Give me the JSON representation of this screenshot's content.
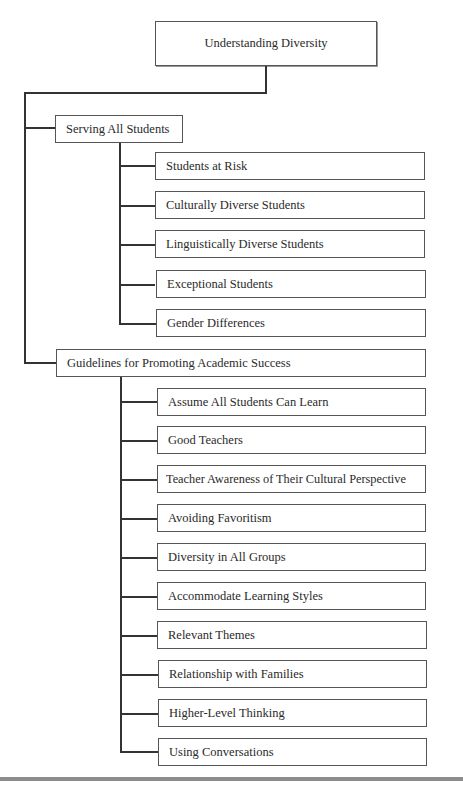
{
  "diagram": {
    "root": {
      "label": "Understanding Diversity"
    },
    "branches": [
      {
        "label": "Serving All Students",
        "children": [
          "Students at Risk",
          "Culturally Diverse Students",
          "Linguistically Diverse Students",
          "Exceptional Students",
          "Gender Differences"
        ]
      },
      {
        "label": "Guidelines for Promoting Academic Success",
        "children": [
          "Assume All Students Can Learn",
          "Good Teachers",
          "Teacher Awareness of Their Cultural Perspective",
          "Avoiding Favoritism",
          "Diversity in All Groups",
          "Accommodate Learning Styles",
          "Relevant Themes",
          "Relationship with Families",
          "Higher-Level Thinking",
          "Using Conversations"
        ]
      }
    ]
  }
}
